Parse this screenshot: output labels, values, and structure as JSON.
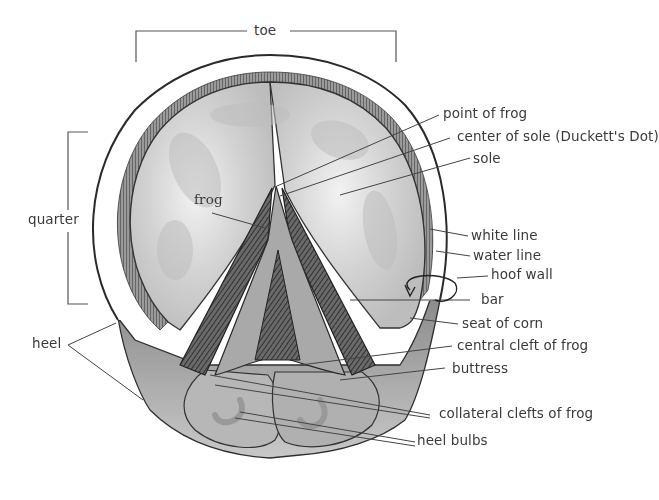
{
  "diagram": {
    "colors": {
      "ink": "#2f2f2f",
      "label": "#3a3a3a",
      "sole_wash": "#c9c9c9",
      "sole_light": "#e6e6e6",
      "frog_dark": "#555555",
      "leader": "#444444"
    },
    "labels": {
      "toe": "toe",
      "quarter": "quarter",
      "heel": "heel",
      "frog": "frog",
      "point_of_frog": "point of frog",
      "center_of_sole": "center of sole (Duckett's Dot)",
      "sole": "sole",
      "white_line": "white line",
      "water_line": "water line",
      "hoof_wall": "hoof wall",
      "bar": "bar",
      "seat_of_corn": "seat of corn",
      "central_cleft": "central cleft of frog",
      "buttress": "buttress",
      "collateral_clefts": "collateral clefts of frog",
      "heel_bulbs": "heel bulbs"
    }
  }
}
